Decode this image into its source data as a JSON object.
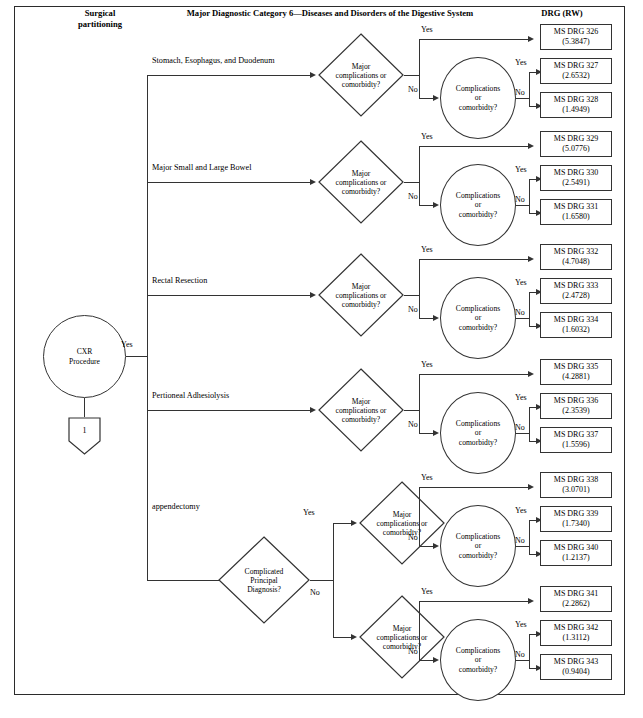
{
  "headers": {
    "left": "Surgical partitioning",
    "left_line1": "Surgical",
    "left_line2": "partitioning",
    "center": "Major Diagnostic Category 6—Diseases and Disorders of the Digestive System",
    "right": "DRG (RW)"
  },
  "root": {
    "label_line1": "CXR",
    "label_line2": "Procedure",
    "yes_label": "Yes",
    "connector": "1"
  },
  "labels": {
    "yes": "Yes",
    "no": "No",
    "major_line1": "Major",
    "major_line2": "complications or",
    "major_line3": "comorbidty?",
    "cc_line1": "Complications",
    "cc_line2": "or",
    "cc_line3": "comorbidty?",
    "cpd_line1": "Complicated",
    "cpd_line2": "Principal",
    "cpd_line3": "Diagnosis?"
  },
  "branches": [
    {
      "name": "Stomach, Esophagus, and Duodenum"
    },
    {
      "name": "Major Small and Large Bowel"
    },
    {
      "name": "Rectal Resection"
    },
    {
      "name": "Pertioneal Adhesiolysis"
    },
    {
      "name": "appendectomy"
    }
  ],
  "drg_rows": [
    {
      "code": "MS DRG 326",
      "rw": "(5.3847)"
    },
    {
      "code": "MS DRG 327",
      "rw": "(2.6532)"
    },
    {
      "code": "MS DRG 328",
      "rw": "(1.4949)"
    },
    {
      "code": "MS DRG 329",
      "rw": "(5.0776)"
    },
    {
      "code": "MS DRG 330",
      "rw": "(2.5491)"
    },
    {
      "code": "MS DRG 331",
      "rw": "(1.6580)"
    },
    {
      "code": "MS DRG 332",
      "rw": "(4.7048)"
    },
    {
      "code": "MS DRG 333",
      "rw": "(2.4728)"
    },
    {
      "code": "MS DRG 334",
      "rw": "(1.6032)"
    },
    {
      "code": "MS DRG 335",
      "rw": "(4.2881)"
    },
    {
      "code": "MS DRG 336",
      "rw": "(2.3539)"
    },
    {
      "code": "MS DRG 337",
      "rw": "(1.5596)"
    },
    {
      "code": "MS DRG 338",
      "rw": "(3.0701)"
    },
    {
      "code": "MS DRG 339",
      "rw": "(1.7340)"
    },
    {
      "code": "MS DRG 340",
      "rw": "(1.2137)"
    },
    {
      "code": "MS DRG 341",
      "rw": "(2.2862)"
    },
    {
      "code": "MS DRG 342",
      "rw": "(1.3112)"
    },
    {
      "code": "MS DRG 343",
      "rw": "(0.9404)"
    }
  ],
  "colors": {
    "line": "#333333",
    "frame": "#2b2b2b",
    "text": "#000000"
  }
}
